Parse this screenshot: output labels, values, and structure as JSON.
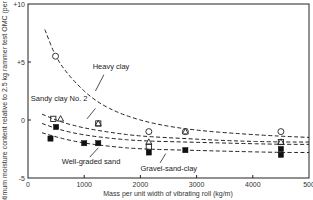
{
  "chart_data": {
    "type": "scatter",
    "title": "",
    "xlabel": "Mass per unit width of vibrating roll (kg/m)",
    "ylabel": "Optimum moisture content relative to 2.5 kg rammer test OMC (per cent)",
    "xlim": [
      0,
      5000
    ],
    "ylim": [
      -5,
      10
    ],
    "x_ticks": [
      "0",
      "1000",
      "2000",
      "3000",
      "4000",
      "500"
    ],
    "x_tick_values": [
      0,
      1000,
      2000,
      3000,
      4000,
      5000
    ],
    "y_ticks": [
      "+10",
      "+5",
      "0",
      "-5"
    ],
    "y_tick_values": [
      10,
      5,
      0,
      -5
    ],
    "grid": false,
    "legend": "none (curves labelled directly)",
    "series": [
      {
        "name": "Heavy clay",
        "marker": "open-circle",
        "points": [
          [
            490,
            5.5
          ],
          [
            2150,
            -1.0
          ],
          [
            2800,
            -1.0
          ],
          [
            4500,
            -1.0
          ]
        ],
        "curve": [
          [
            300,
            7.8
          ],
          [
            500,
            5.3
          ],
          [
            800,
            3.4
          ],
          [
            1200,
            1.6
          ],
          [
            1700,
            0.4
          ],
          [
            2300,
            -0.4
          ],
          [
            3000,
            -0.9
          ],
          [
            3800,
            -1.2
          ],
          [
            4500,
            -1.4
          ],
          [
            5000,
            -1.5
          ]
        ]
      },
      {
        "name": "Sandy clay No. 2",
        "marker": "open-triangle",
        "points": [
          [
            580,
            0.1
          ],
          [
            1250,
            -0.3
          ],
          [
            2150,
            -1.9
          ],
          [
            2800,
            -1.0
          ],
          [
            4500,
            -1.9
          ]
        ],
        "curve": [
          [
            250,
            0.5
          ],
          [
            600,
            -0.2
          ],
          [
            1000,
            -0.7
          ],
          [
            1500,
            -1.1
          ],
          [
            2000,
            -1.4
          ],
          [
            2800,
            -1.6
          ],
          [
            3600,
            -1.8
          ],
          [
            4500,
            -1.9
          ],
          [
            5000,
            -1.9
          ]
        ]
      },
      {
        "name": "Gravel-sand-clay",
        "marker": "open-square",
        "points": [
          [
            450,
            0.1
          ],
          [
            1250,
            -0.3
          ],
          [
            2150,
            -2.3
          ],
          [
            4500,
            -1.9
          ]
        ],
        "curve": [
          [
            250,
            -0.3
          ],
          [
            600,
            -0.9
          ],
          [
            1000,
            -1.3
          ],
          [
            1500,
            -1.6
          ],
          [
            2000,
            -1.8
          ],
          [
            2800,
            -1.9
          ],
          [
            3600,
            -2.0
          ],
          [
            4500,
            -2.1
          ],
          [
            5000,
            -2.1
          ]
        ]
      },
      {
        "name": "Well-graded sand",
        "marker": "filled-square",
        "points": [
          [
            500,
            -0.6
          ],
          [
            400,
            -1.6
          ],
          [
            1000,
            -2.0
          ],
          [
            1250,
            -2.0
          ],
          [
            2150,
            -2.8
          ],
          [
            2800,
            -2.6
          ],
          [
            4500,
            -2.5
          ],
          [
            4500,
            -3.0
          ]
        ],
        "curve": [
          [
            250,
            -1.1
          ],
          [
            600,
            -1.6
          ],
          [
            1000,
            -2.0
          ],
          [
            1500,
            -2.3
          ],
          [
            2000,
            -2.5
          ],
          [
            2800,
            -2.6
          ],
          [
            3600,
            -2.7
          ],
          [
            4500,
            -2.8
          ],
          [
            5000,
            -2.8
          ]
        ]
      }
    ],
    "annotations": [
      {
        "text": "Heavy clay",
        "x": 1150,
        "y": 4.4
      },
      {
        "text": "Sandy clay No. 2",
        "x": 50,
        "y": 1.6
      },
      {
        "text": "Well-graded sand",
        "x": 600,
        "y": -3.8
      },
      {
        "text": "Gravel-sand-clay",
        "x": 2000,
        "y": -4.4
      }
    ]
  }
}
